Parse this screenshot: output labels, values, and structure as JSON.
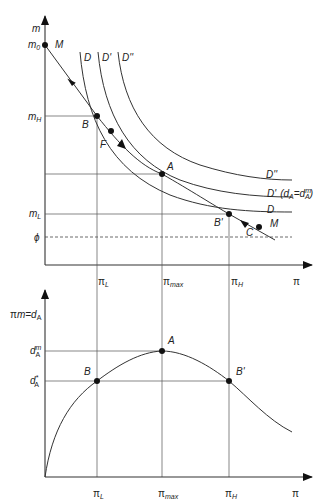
{
  "top_panel": {
    "y_axis_label": "m",
    "x_axis_label": "π",
    "y_ticks": {
      "m0": "m",
      "m0_sub": "0",
      "mH": "m",
      "mH_sub": "H",
      "mL": "m",
      "mL_sub": "L",
      "phi": "ϕ"
    },
    "x_ticks": {
      "pi_L": "π",
      "pi_L_sub": "L",
      "pi_max": "π",
      "pi_max_sub": "max",
      "pi_H": "π",
      "pi_H_sub": "H",
      "pi": "π"
    },
    "curve_labels": {
      "D_top": "D",
      "Dp_top": "D'",
      "Dpp_top": "D''",
      "Dpp_right": "D''",
      "Dp_right": "D'",
      "Dp_note_open": "(d",
      "Dp_note_sub1": "A",
      "Dp_note_eq": "=d",
      "Dp_note_sup": "m",
      "Dp_note_sub2": "A",
      "Dp_note_close": ")",
      "D_right": "D"
    },
    "points": {
      "M_top": "M",
      "B": "B",
      "F": "F",
      "A": "A",
      "B_prime": "B'",
      "C": "C",
      "M_bottom": "M"
    }
  },
  "bottom_panel": {
    "y_axis_label_pi": "π",
    "y_axis_label_rest": "m=d",
    "y_axis_label_sub": "A",
    "x_axis_label": "π",
    "y_ticks": {
      "dAm": "d",
      "dAm_sup": "m",
      "dAm_sub": "A",
      "dAstar": "d",
      "dAstar_sup": "*",
      "dAstar_sub": "A"
    },
    "x_ticks": {
      "pi_L": "π",
      "pi_L_sub": "L",
      "pi_max": "π",
      "pi_max_sub": "max",
      "pi_H": "π",
      "pi_H_sub": "H",
      "pi": "π"
    },
    "points": {
      "A": "A",
      "B": "B",
      "B_prime": "B'"
    }
  }
}
